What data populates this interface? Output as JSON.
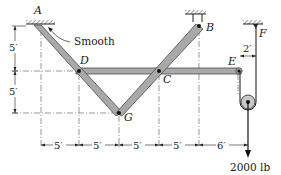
{
  "diagram": {
    "type": "statics-frame",
    "points": {
      "A": "A",
      "B": "B",
      "C": "C",
      "D": "D",
      "E": "E",
      "F": "F",
      "G": "G"
    },
    "annotations": {
      "smooth": "Smooth",
      "load": "2000 lb"
    },
    "horizontal_dimensions": [
      "5′",
      "5′",
      "5′",
      "5′",
      "6′"
    ],
    "vertical_dimensions": [
      "5′",
      "5′"
    ],
    "offset_dimension": "2′",
    "colors": {
      "member_fill": "#a9a9a9",
      "member_stroke": "#4a4a4a",
      "line": "#1a1a1a",
      "pulley_fill": "#c8c8c8"
    }
  }
}
